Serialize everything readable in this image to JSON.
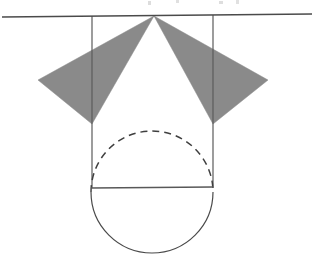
{
  "figure": {
    "canvas": {
      "width": 322,
      "height": 264,
      "background": "#ffffff"
    },
    "colors": {
      "stroke": "#4a4a4a",
      "stroke_light": "#6f6f6f",
      "shaded_fill": "#8a8a8a",
      "background": "#ffffff"
    },
    "stroke_widths": {
      "baseline": 1.3,
      "vertical": 1.2,
      "circle": 1.2,
      "diameter": 1.4,
      "dashed": 1.4
    },
    "elements": {
      "baseline": {
        "label": "horizontal-baseline",
        "x1": 2,
        "y1": 17,
        "x2": 312,
        "y2": 14
      },
      "apex": {
        "label": "cone-apex-point",
        "x": 154,
        "y": 16
      },
      "left_triangle": {
        "label": "left-shaded-triangle",
        "points": "154,16 38,80 92,124",
        "fill": "#8a8a8a"
      },
      "right_triangle": {
        "label": "right-shaded-triangle",
        "points": "154,16 268,80 213,124",
        "fill": "#8a8a8a"
      },
      "left_vertical": {
        "label": "left-vertical-line",
        "x1": 92,
        "y1": 16,
        "x2": 92,
        "y2": 188
      },
      "right_vertical": {
        "label": "right-vertical-line",
        "x1": 213,
        "y1": 15,
        "x2": 213,
        "y2": 188
      },
      "circle": {
        "label": "inscribed-circle",
        "cx": 152,
        "cy": 192,
        "r": 61
      },
      "lower_semicircle": {
        "label": "solid-lower-semicircle",
        "path": "M 91 192 A 61 61 0 0 0 213 192"
      },
      "upper_semicircle": {
        "label": "dashed-upper-semicircle",
        "path": "M 91 192 A 61 61 0 0 1 213 192",
        "dash_pattern": "7 5"
      },
      "diameter": {
        "label": "horizontal-diameter-line",
        "x1": 91,
        "y1": 188,
        "x2": 213,
        "y2": 187
      }
    },
    "artifacts": {
      "label": "scan-text-remnant-top",
      "description": "faint cropped text fragments along the very top edge",
      "marks": [
        {
          "x": 148,
          "y": 2,
          "w": 3,
          "h": 4
        },
        {
          "x": 176,
          "y": 1,
          "w": 3,
          "h": 3
        },
        {
          "x": 219,
          "y": 2,
          "w": 4,
          "h": 3
        },
        {
          "x": 236,
          "y": 1,
          "w": 3,
          "h": 4
        }
      ]
    }
  }
}
